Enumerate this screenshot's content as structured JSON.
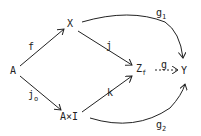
{
  "nodes": {
    "A": {
      "label": "A"
    },
    "X": {
      "label": "X"
    },
    "AxI": {
      "label": "A×I"
    },
    "Zf": {
      "label": "Z",
      "sub": "f"
    },
    "Y": {
      "label": "Y"
    }
  },
  "arrows": {
    "f": {
      "label": "f",
      "from": "A",
      "to": "X",
      "style": "solid"
    },
    "j": {
      "label": "j",
      "from": "X",
      "to": "Zf",
      "style": "solid"
    },
    "j0": {
      "label": "j",
      "sub": "o",
      "from": "A",
      "to": "AxI",
      "style": "solid"
    },
    "k": {
      "label": "k",
      "from": "AxI",
      "to": "Zf",
      "style": "solid"
    },
    "g": {
      "label": "g",
      "from": "Zf",
      "to": "Y",
      "style": "dashed"
    },
    "g1": {
      "label": "g",
      "sub": "1",
      "from": "X",
      "to": "Y",
      "style": "curved"
    },
    "g2": {
      "label": "g",
      "sub": "2",
      "from": "AxI",
      "to": "Y",
      "style": "curved"
    }
  },
  "colors": {
    "stroke": "#222222",
    "background": "#ffffff"
  }
}
